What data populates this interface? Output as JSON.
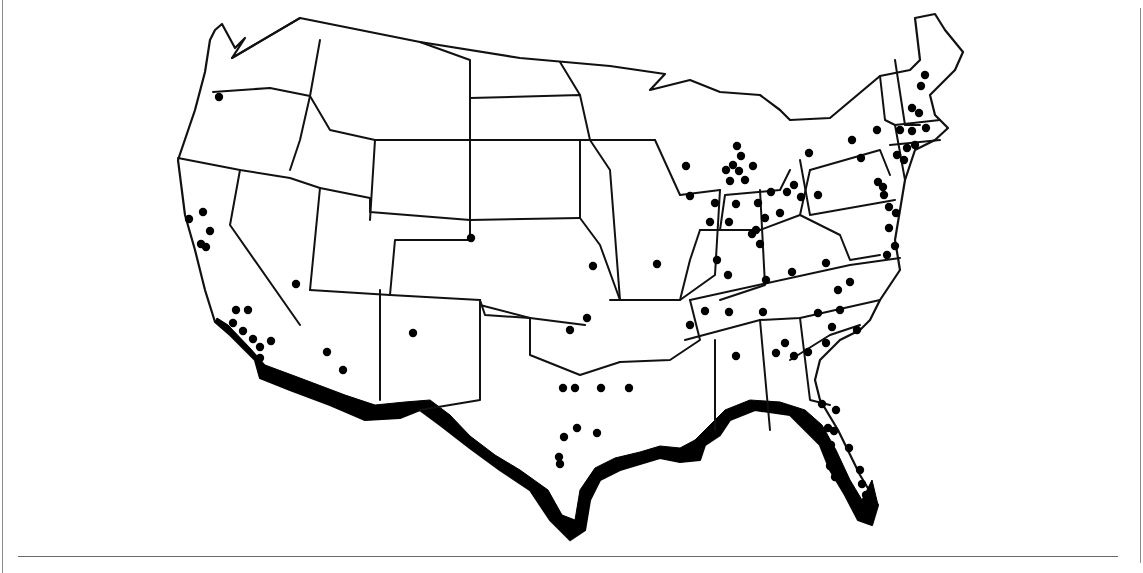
{
  "figure": {
    "type": "map",
    "colors": {
      "outline": "#111111",
      "dots": "#000000",
      "band": "#000000",
      "background": "#ffffff",
      "frame": "#8a8a8a"
    }
  },
  "map": {
    "outline_points": "215,30 222,24 235,48 245,38 232,58 300,18 420,42 520,58 610,66 665,74 650,90 690,80 720,92 760,95 780,110 790,120 830,118 880,76 910,70 920,60 915,18 935,14 945,30 963,52 955,70 930,95 935,115 948,128 935,140 915,150 905,180 900,210 895,240 900,270 880,300 870,320 860,330 840,340 820,360 815,380 820,400 838,430 860,475 878,505 872,525 858,520 845,495 830,470 820,445 800,425 790,415 755,410 730,420 720,435 705,445 700,460 680,462 660,458 620,470 600,480 590,500 585,530 570,540 550,520 530,490 500,470 470,448 440,425 420,410 400,418 365,420 330,405 290,390 260,378 255,360 230,335 215,322 205,290 195,250 185,215 178,160 195,110 205,72 210,40",
    "state_lines": [
      "232,58 300,18",
      "213,92 270,88 310,96 300,140 290,170",
      "320,40 310,96 330,130 375,140 370,220",
      "178,158 240,170 290,178 320,188",
      "240,170 230,225 300,325",
      "320,188 370,198 370,212 470,220",
      "320,188 310,290",
      "375,140 470,140 470,220 580,218",
      "470,220 470,240 395,240 390,295 310,290",
      "390,295 480,300 485,315 530,318 585,325",
      "480,300 480,305 530,318",
      "470,140 580,140 580,218 600,245 620,300",
      "420,42 470,60 470,140",
      "470,98 580,95 590,140 610,170 620,300",
      "560,62 580,95",
      "580,140 655,140",
      "530,318 530,355 580,375 620,362",
      "380,290 380,400",
      "480,300 480,400 420,410",
      "610,300 680,300 690,260 700,230 720,230 725,195 780,190 790,170",
      "620,362 670,360 700,340 690,300",
      "655,140 680,195 720,190",
      "700,230 760,230 800,215 810,170",
      "720,190 715,275 680,300",
      "760,190 765,285 720,300",
      "690,300 850,265 900,258",
      "685,340 760,320 800,318 880,300",
      "715,340 715,430",
      "760,320 770,430",
      "800,318 810,400 830,405",
      "790,360 830,335 860,325",
      "800,160 810,215 895,200",
      "810,170 880,150 890,175",
      "880,76 885,120 895,125 905,180",
      "895,60 905,125 920,125",
      "895,125 940,120",
      "890,145 940,140",
      "800,215 820,225 840,235 850,260 880,255"
    ],
    "coastal_band": [
      "215,322 230,335 255,360 260,378 290,390 330,405 365,420 400,418 420,410 440,425 470,448 500,470 530,490 550,520 570,540 585,530 590,500 600,480 620,470 660,458 680,462 700,460 705,445 720,435 730,420 755,410 790,415 800,425 820,445 830,470 845,495 858,520 872,525 878,505 872,480 862,500 850,480 836,450 822,425 805,410 780,402 750,400 725,410 710,425 695,440 680,448 660,446 640,452 615,458 595,468 580,490 575,520 562,515 548,490 520,470 495,455 470,436 450,415 430,400 405,402 375,405 345,395 300,378 265,365 250,348 228,325 217,318"
    ],
    "markers": [
      [
        219,
        97
      ],
      [
        203,
        212
      ],
      [
        189,
        219
      ],
      [
        210,
        231
      ],
      [
        201,
        244
      ],
      [
        206,
        247
      ],
      [
        296,
        284
      ],
      [
        236,
        310
      ],
      [
        248,
        310
      ],
      [
        233,
        323
      ],
      [
        243,
        331
      ],
      [
        253,
        339
      ],
      [
        260,
        347
      ],
      [
        271,
        341
      ],
      [
        260,
        358
      ],
      [
        327,
        352
      ],
      [
        343,
        370
      ],
      [
        413,
        333
      ],
      [
        471,
        238
      ],
      [
        570,
        330
      ],
      [
        587,
        318
      ],
      [
        563,
        388
      ],
      [
        575,
        388
      ],
      [
        601,
        388
      ],
      [
        629,
        388
      ],
      [
        564,
        437
      ],
      [
        577,
        428
      ],
      [
        597,
        433
      ],
      [
        559,
        457
      ],
      [
        560,
        464
      ],
      [
        593,
        266
      ],
      [
        657,
        264
      ],
      [
        686,
        166
      ],
      [
        690,
        196
      ],
      [
        737,
        146
      ],
      [
        741,
        156
      ],
      [
        733,
        165
      ],
      [
        739,
        171
      ],
      [
        753,
        166
      ],
      [
        726,
        170
      ],
      [
        730,
        181
      ],
      [
        745,
        180
      ],
      [
        715,
        203
      ],
      [
        736,
        204
      ],
      [
        710,
        222
      ],
      [
        729,
        222
      ],
      [
        717,
        260
      ],
      [
        728,
        275
      ],
      [
        758,
        203
      ],
      [
        771,
        192
      ],
      [
        765,
        218
      ],
      [
        756,
        230
      ],
      [
        780,
        213
      ],
      [
        752,
        234
      ],
      [
        760,
        244
      ],
      [
        794,
        185
      ],
      [
        801,
        197
      ],
      [
        787,
        192
      ],
      [
        818,
        195
      ],
      [
        766,
        280
      ],
      [
        792,
        272
      ],
      [
        826,
        263
      ],
      [
        838,
        290
      ],
      [
        850,
        282
      ],
      [
        818,
        313
      ],
      [
        840,
        310
      ],
      [
        705,
        311
      ],
      [
        690,
        325
      ],
      [
        729,
        312
      ],
      [
        763,
        312
      ],
      [
        776,
        353
      ],
      [
        785,
        343
      ],
      [
        808,
        352
      ],
      [
        832,
        327
      ],
      [
        857,
        330
      ],
      [
        826,
        343
      ],
      [
        736,
        356
      ],
      [
        794,
        356
      ],
      [
        822,
        404
      ],
      [
        828,
        428
      ],
      [
        821,
        432
      ],
      [
        834,
        431
      ],
      [
        831,
        445
      ],
      [
        849,
        448
      ],
      [
        830,
        466
      ],
      [
        845,
        480
      ],
      [
        835,
        477
      ],
      [
        860,
        470
      ],
      [
        862,
        484
      ],
      [
        836,
        410
      ],
      [
        866,
        495
      ],
      [
        809,
        153
      ],
      [
        852,
        140
      ],
      [
        861,
        158
      ],
      [
        877,
        130
      ],
      [
        883,
        187
      ],
      [
        878,
        182
      ],
      [
        884,
        195
      ],
      [
        889,
        228
      ],
      [
        896,
        213
      ],
      [
        889,
        207
      ],
      [
        895,
        246
      ],
      [
        887,
        255
      ],
      [
        925,
        75
      ],
      [
        921,
        86
      ],
      [
        912,
        108
      ],
      [
        919,
        113
      ],
      [
        926,
        128
      ],
      [
        912,
        131
      ],
      [
        900,
        130
      ],
      [
        907,
        148
      ],
      [
        915,
        145
      ],
      [
        897,
        155
      ],
      [
        904,
        160
      ]
    ]
  }
}
